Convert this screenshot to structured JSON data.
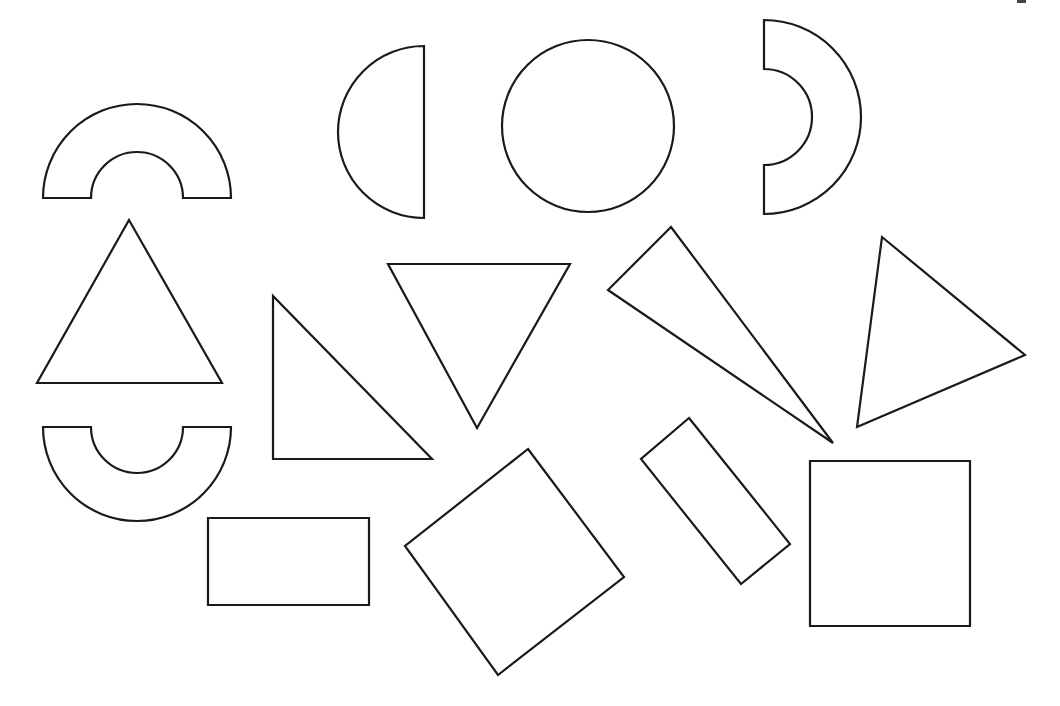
{
  "colors": {
    "stroke": "#1a1a1a",
    "fill": "#ffffff",
    "background": "#ffffff"
  },
  "shapes": [
    {
      "id": "arch-top-left",
      "type": "half-ring",
      "orientation": "opening-down",
      "center": [
        137,
        198
      ],
      "outer_radius": 94,
      "inner_radius": 46
    },
    {
      "id": "half-disc",
      "type": "semicircle",
      "orientation": "flat-right",
      "center": [
        424,
        132
      ],
      "radius": 86
    },
    {
      "id": "circle",
      "type": "circle",
      "center": [
        588,
        126
      ],
      "radius": 86
    },
    {
      "id": "arch-right",
      "type": "half-ring",
      "orientation": "opening-left",
      "center": [
        764,
        117
      ],
      "outer_radius": 97,
      "inner_radius": 48
    },
    {
      "id": "triangle-equilateral",
      "type": "triangle",
      "points": [
        [
          129,
          220
        ],
        [
          222,
          383
        ],
        [
          37,
          383
        ]
      ]
    },
    {
      "id": "triangle-right",
      "type": "triangle",
      "points": [
        [
          273,
          296
        ],
        [
          273,
          459
        ],
        [
          432,
          459
        ]
      ]
    },
    {
      "id": "triangle-inverted",
      "type": "triangle",
      "points": [
        [
          388,
          264
        ],
        [
          570,
          264
        ],
        [
          477,
          428
        ]
      ]
    },
    {
      "id": "triangle-thin",
      "type": "triangle",
      "points": [
        [
          671,
          227
        ],
        [
          608,
          290
        ],
        [
          833,
          443
        ]
      ]
    },
    {
      "id": "triangle-scalene",
      "type": "triangle",
      "points": [
        [
          882,
          237
        ],
        [
          1025,
          355
        ],
        [
          857,
          427
        ]
      ]
    },
    {
      "id": "arch-bottom-left",
      "type": "half-ring",
      "orientation": "opening-up",
      "center": [
        137,
        427
      ],
      "outer_radius": 94,
      "inner_radius": 46
    },
    {
      "id": "rectangle-horizontal",
      "type": "rectangle",
      "points": [
        [
          208,
          518
        ],
        [
          369,
          518
        ],
        [
          369,
          605
        ],
        [
          208,
          605
        ]
      ]
    },
    {
      "id": "square-rotated",
      "type": "square",
      "points": [
        [
          528,
          449
        ],
        [
          624,
          577
        ],
        [
          498,
          675
        ],
        [
          405,
          546
        ]
      ]
    },
    {
      "id": "rectangle-rotated",
      "type": "rectangle",
      "points": [
        [
          689,
          418
        ],
        [
          790,
          544
        ],
        [
          741,
          584
        ],
        [
          641,
          459
        ]
      ]
    },
    {
      "id": "square",
      "type": "square",
      "points": [
        [
          810,
          461
        ],
        [
          970,
          461
        ],
        [
          970,
          626
        ],
        [
          810,
          626
        ]
      ]
    }
  ]
}
